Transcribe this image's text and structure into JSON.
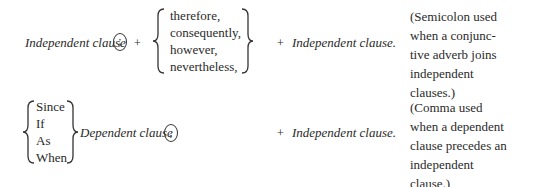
{
  "row1": {
    "left_clause": "Independent clause",
    "punctuation": ";",
    "plus1": "+",
    "adverbs": [
      "therefore,",
      "consequently,",
      "however,",
      "nevertheless,"
    ],
    "plus2": "+",
    "right_clause": "Independent clause.",
    "note": [
      "(Semicolon used",
      "when a conjunc-",
      "tive adverb joins",
      "independent",
      "clauses.)"
    ]
  },
  "row2": {
    "subordinators": [
      "Since",
      "If",
      "As",
      "When"
    ],
    "dependent_clause": "Dependent clause",
    "punctuation": ",",
    "plus": "+",
    "right_clause": "Independent clause.",
    "note": [
      "(Comma used",
      "when a dependent",
      "clause precedes an",
      "independent",
      "clause.)"
    ]
  }
}
